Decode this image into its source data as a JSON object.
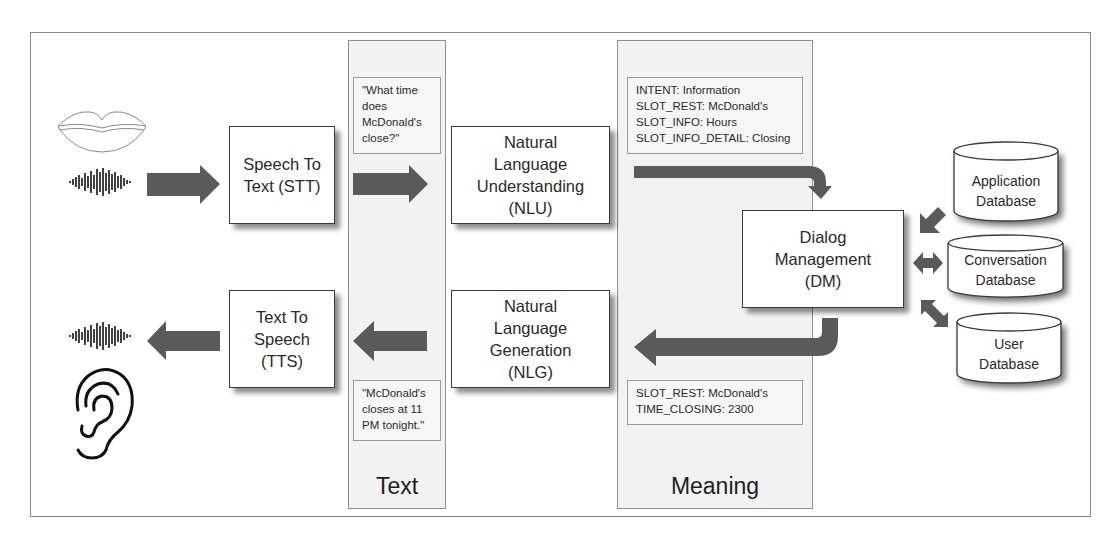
{
  "diagram": {
    "type": "conversational-ai-pipeline",
    "colors": {
      "arrow": "#5a5a5a",
      "column_bg": "#f2f2f2",
      "box_border": "#3a3a3a",
      "frame_border": "#8a8a8a"
    },
    "icons": {
      "lips": "lips-icon",
      "waveform_input": "sound-wave-icon",
      "waveform_output": "sound-wave-icon",
      "ear": "ear-icon"
    },
    "columns": {
      "text": {
        "label": "Text"
      },
      "meaning": {
        "label": "Meaning"
      }
    },
    "nodes": {
      "stt": {
        "label": "Speech To\nText (STT)"
      },
      "nlu": {
        "label": "Natural\nLanguage\nUnderstanding\n(NLU)"
      },
      "dm": {
        "label": "Dialog\nManagement\n(DM)"
      },
      "nlg": {
        "label": "Natural\nLanguage\nGeneration\n(NLG)"
      },
      "tts": {
        "label": "Text To\nSpeech\n(TTS)"
      }
    },
    "notes": {
      "user_utterance": [
        "\"What time",
        "does",
        "McDonald's",
        "close?\""
      ],
      "nlu_output": [
        "INTENT: Information",
        "SLOT_REST: McDonald's",
        "SLOT_INFO: Hours",
        "SLOT_INFO_DETAIL: Closing"
      ],
      "dm_output": [
        "SLOT_REST: McDonald's",
        "TIME_CLOSING: 2300"
      ],
      "system_response": [
        "\"McDonald's",
        "closes at 11",
        "PM tonight.\""
      ]
    },
    "databases": [
      {
        "label": "Application\nDatabase"
      },
      {
        "label": "Conversation\nDatabase"
      },
      {
        "label": "User\nDatabase"
      }
    ]
  }
}
